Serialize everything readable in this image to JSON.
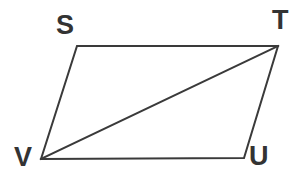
{
  "figure": {
    "name": "parallelogram-stuv-with-diagonal",
    "background_color": "#ffffff",
    "stroke_color": "#3a3a3a",
    "stroke_width": 2,
    "label_color": "#333333",
    "label_font_size": 27,
    "vertices": [
      {
        "id": "S",
        "label": "S",
        "x": 77,
        "y": 46,
        "label_x": 56,
        "label_y": 12
      },
      {
        "id": "T",
        "label": "T",
        "x": 278,
        "y": 46,
        "label_x": 272,
        "label_y": 7
      },
      {
        "id": "U",
        "label": "U",
        "x": 244,
        "y": 158,
        "label_x": 249,
        "label_y": 143
      },
      {
        "id": "V",
        "label": "V",
        "x": 41,
        "y": 159,
        "label_x": 14,
        "label_y": 144
      }
    ],
    "edges": [
      {
        "id": "ST",
        "from": "S",
        "to": "T",
        "kind": "side"
      },
      {
        "id": "TU",
        "from": "T",
        "to": "U",
        "kind": "side"
      },
      {
        "id": "UV",
        "from": "U",
        "to": "V",
        "kind": "side"
      },
      {
        "id": "VS",
        "from": "V",
        "to": "S",
        "kind": "side"
      },
      {
        "id": "VT",
        "from": "V",
        "to": "T",
        "kind": "diagonal"
      }
    ],
    "outline_points": "77,46 278,46 244,158 41,159",
    "diagonal_points": "41,159 278,46"
  }
}
